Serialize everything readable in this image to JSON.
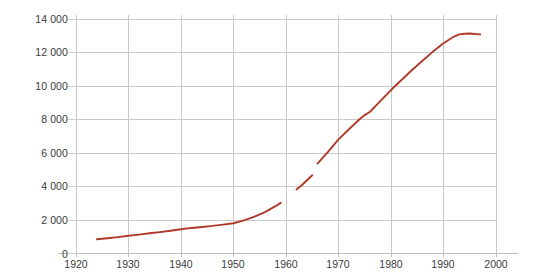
{
  "chart_data": {
    "type": "line",
    "title": "",
    "subtitle": "",
    "xlabel": "",
    "ylabel": "",
    "xlim": [
      1915,
      2005
    ],
    "ylim": [
      0,
      14800
    ],
    "xticks": [
      1920,
      1930,
      1940,
      1950,
      1960,
      1970,
      1980,
      1990,
      2000
    ],
    "xticklabels": [
      "1920",
      "1930",
      "1940",
      "1950",
      "1960",
      "1970",
      "1980",
      "1990",
      "2000"
    ],
    "yticks": [
      0,
      2000,
      4000,
      6000,
      8000,
      10000,
      12000,
      14000
    ],
    "yticklabels": [
      "0",
      "2 000",
      "4 000",
      "6 000",
      "8 000",
      "10 000",
      "12 000",
      "14 000"
    ],
    "grid": "both",
    "legend": "none",
    "line_color": "#b03a2a",
    "grid_color": "#c9c9c9",
    "axis_color": "#bdbdbd",
    "series": [
      {
        "name": "series-1",
        "color": "#b03a2a",
        "segments": [
          {
            "name": "segment-1",
            "x": [
              1924,
              1926,
              1928,
              1930,
              1932,
              1934,
              1936,
              1938,
              1940,
              1942,
              1944,
              1946,
              1948,
              1950,
              1952,
              1954,
              1956,
              1958,
              1959
            ],
            "y": [
              820,
              880,
              950,
              1030,
              1100,
              1180,
              1250,
              1330,
              1420,
              1500,
              1560,
              1620,
              1700,
              1780,
              1950,
              2180,
              2450,
              2800,
              3000
            ]
          },
          {
            "name": "segment-2",
            "x": [
              1962,
              1963,
              1964,
              1965
            ],
            "y": [
              3800,
              4050,
              4350,
              4650
            ]
          },
          {
            "name": "segment-3",
            "x": [
              1966,
              1968,
              1970,
              1972,
              1974,
              1975,
              1976,
              1978,
              1980,
              1982,
              1984,
              1986,
              1988,
              1990,
              1992,
              1993,
              1994,
              1995,
              1996,
              1997
            ],
            "y": [
              5350,
              6050,
              6800,
              7400,
              8000,
              8250,
              8450,
              9100,
              9750,
              10350,
              10950,
              11500,
              12050,
              12550,
              12950,
              13080,
              13120,
              13130,
              13100,
              13080
            ]
          }
        ]
      }
    ]
  }
}
